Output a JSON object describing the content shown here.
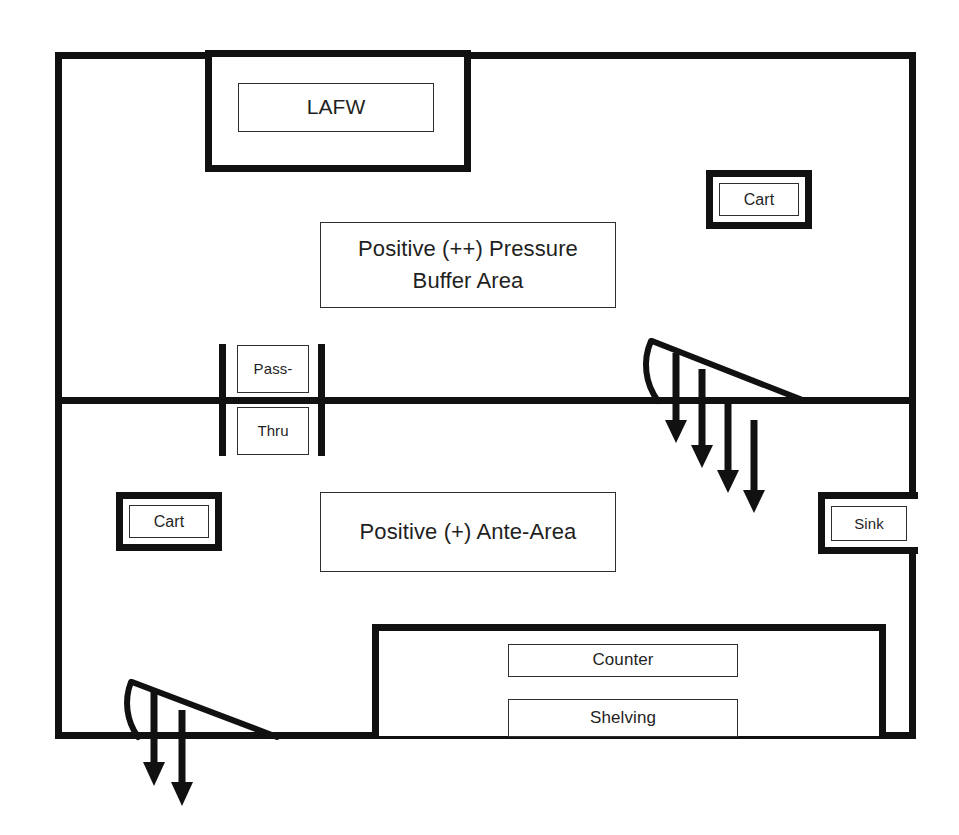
{
  "diagram": {
    "colors": {
      "wall": "#111111",
      "thin_line": "#2e2e2e",
      "arrow": "#111111",
      "background": "#ffffff"
    },
    "rooms": [
      {
        "name": "buffer-area",
        "label": "Positive (++) Pressure\nBuffer Area"
      },
      {
        "name": "ante-area",
        "label": "Positive (+) Ante-Area"
      }
    ],
    "equipment": {
      "lafw": {
        "label": "LAFW"
      },
      "cart_buffer": {
        "label": "Cart"
      },
      "cart_ante": {
        "label": "Cart"
      },
      "sink": {
        "label": "Sink"
      },
      "counter": {
        "label": "Counter"
      },
      "shelving": {
        "label": "Shelving"
      },
      "pass_thru_top": {
        "label": "Pass-"
      },
      "pass_thru_bottom": {
        "label": "Thru"
      }
    },
    "airflow": {
      "buffer_to_ante_door": {
        "arrow_count": 4
      },
      "ante_to_exterior_door": {
        "arrow_count": 2
      }
    }
  }
}
